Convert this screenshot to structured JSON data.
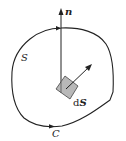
{
  "diagram": {
    "labels": {
      "normal": "n",
      "surface": "S",
      "curve": "C",
      "element_d": "d",
      "element_s": "S"
    },
    "colors": {
      "stroke": "#222222",
      "patch_fill": "#b8b8b8",
      "background": "#ffffff"
    }
  }
}
